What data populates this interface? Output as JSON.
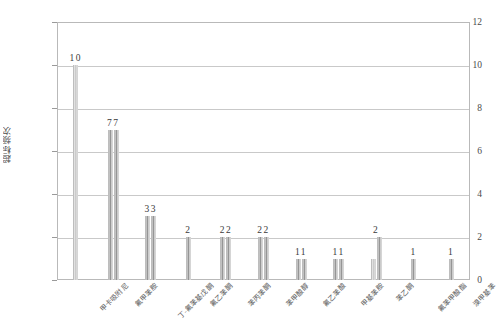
{
  "chart_data": {
    "type": "bar",
    "title": "",
    "xlabel": "",
    "ylabel": "超标频次",
    "ylim": [
      0,
      12
    ],
    "yticks": [
      0,
      2,
      4,
      6,
      8,
      10,
      12
    ],
    "grid": true,
    "legend": "none",
    "categories": [
      "甲卡吸附尼",
      "氟甲苯胺",
      "丁-氟苯基戊酮",
      "氟乙苯酮",
      "苯丙苯酮",
      "苯甲酸醇",
      "氟乙苯酸",
      "甲基苯胺",
      "苯乙酮",
      "氟苯甲酸酯",
      "溴甲基苯"
    ],
    "series": [
      {
        "name": "超标频次",
        "bars": [
          {
            "category": "甲卡吸附尼",
            "values": [
              10
            ],
            "label": "10"
          },
          {
            "category": "氟甲苯胺",
            "values": [
              7,
              7
            ],
            "label": "77"
          },
          {
            "category": "丁-氟苯基戊酮",
            "values": [
              3,
              3
            ],
            "label": "33"
          },
          {
            "category": "氟乙苯酮",
            "values": [
              2
            ],
            "label": "2"
          },
          {
            "category": "苯丙苯酮",
            "values": [
              2,
              2
            ],
            "label": "22"
          },
          {
            "category": "苯甲酸醇",
            "values": [
              2,
              2
            ],
            "label": "22"
          },
          {
            "category": "氟乙苯酸",
            "values": [
              1,
              1
            ],
            "label": "11"
          },
          {
            "category": "甲基苯胺",
            "values": [
              1,
              1
            ],
            "label": "11"
          },
          {
            "category": "苯乙酮",
            "values": [
              1,
              2
            ],
            "label": "2"
          },
          {
            "category": "氟苯甲酸酯",
            "values": [
              1
            ],
            "label": "1"
          },
          {
            "category": "溴甲基苯",
            "values": [
              1
            ],
            "label": "1"
          }
        ]
      }
    ]
  },
  "axis": {
    "y_tick_labels": [
      "0",
      "2",
      "4",
      "6",
      "8",
      "10",
      "12"
    ]
  }
}
